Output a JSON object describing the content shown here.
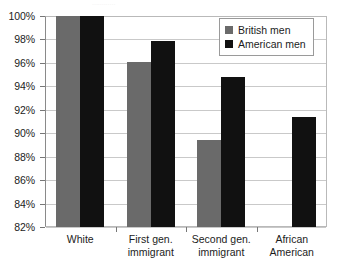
{
  "chart_data": {
    "type": "bar",
    "title": "",
    "xlabel": "",
    "ylabel": "",
    "ylim": [
      82,
      100
    ],
    "ytick_labels": [
      "100%",
      "98%",
      "96%",
      "94%",
      "92%",
      "90%",
      "88%",
      "86%",
      "84%",
      "82%"
    ],
    "ytick_values": [
      100,
      98,
      96,
      94,
      92,
      90,
      88,
      86,
      84,
      82
    ],
    "grid": true,
    "legend_position": "top-right",
    "unit": "%",
    "categories": [
      [
        "White"
      ],
      [
        "First gen.",
        "immigrant"
      ],
      [
        "Second gen.",
        "immigrant"
      ],
      [
        "African",
        "American"
      ]
    ],
    "series": [
      {
        "name": "British men",
        "color": "#6a6a6a",
        "values": [
          100,
          96.1,
          89.4,
          null
        ]
      },
      {
        "name": "American men",
        "color": "#111111",
        "values": [
          100,
          97.9,
          94.8,
          91.4
        ]
      }
    ]
  },
  "title_remnant": "............",
  "colors": {
    "british": "#6a6a6a",
    "american": "#111111",
    "gridline": "#c9c9c9",
    "axis": "#8a8a8a",
    "text": "#1c1c1c",
    "background": "#ffffff"
  }
}
